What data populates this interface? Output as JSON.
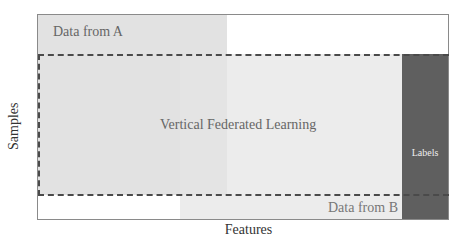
{
  "diagram": {
    "title": "Vertical Federated Learning",
    "axes": {
      "x_label": "Features",
      "y_label": "Samples"
    },
    "regions": [
      {
        "id": "data-a",
        "label": "Data from A",
        "color": "#e2e2e2"
      },
      {
        "id": "data-b",
        "label": "Data from B",
        "color": "#ececec"
      },
      {
        "id": "overlap",
        "label": "Vertical Federated Learning",
        "style": "dashed-border"
      },
      {
        "id": "labels",
        "label": "Labels",
        "color": "#5f5f5f"
      }
    ]
  }
}
